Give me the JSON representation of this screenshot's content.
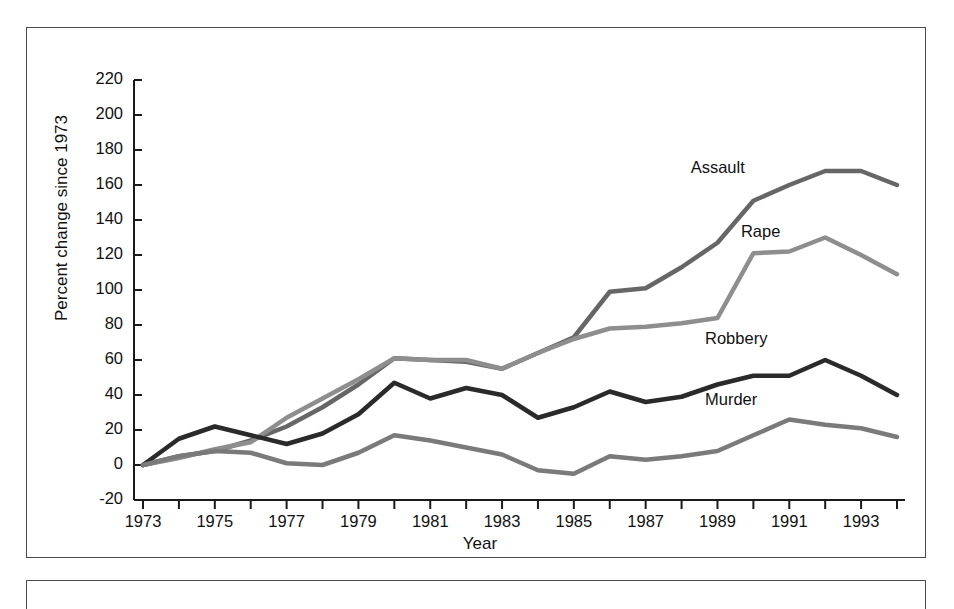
{
  "figure": {
    "ylabel": "Percent change since 1973",
    "xlabel": "Year"
  },
  "axis": {
    "y_ticks": [
      "220",
      "200",
      "180",
      "160",
      "140",
      "120",
      "100",
      "80",
      "60",
      "40",
      "20",
      "0",
      "-20"
    ],
    "x_ticks": [
      "1973",
      "1975",
      "1977",
      "1979",
      "1981",
      "1983",
      "1985",
      "1987",
      "1989",
      "1991",
      "1993"
    ]
  },
  "series_labels": {
    "assault": "Assault",
    "rape": "Rape",
    "robbery": "Robbery",
    "murder": "Murder"
  },
  "colors": {
    "assault": "#666666",
    "rape": "#8e8e8e",
    "robbery": "#2a2a2a",
    "murder": "#7a7a7a",
    "axis": "#1a1a1a",
    "frame": "#4a4a4a",
    "background": "#ffffff"
  },
  "chart_data": {
    "type": "line",
    "title": "",
    "subtitle": "",
    "xlabel": "Year",
    "ylabel": "Percent change since 1973",
    "xlim": [
      1973,
      1994
    ],
    "ylim": [
      -20,
      220
    ],
    "ytick_step": 20,
    "xtick_step": 1,
    "xtick_label_step": 2,
    "grid": false,
    "legend": "inline-labels",
    "x": [
      1973,
      1974,
      1975,
      1976,
      1977,
      1978,
      1979,
      1980,
      1981,
      1982,
      1983,
      1984,
      1985,
      1986,
      1987,
      1988,
      1989,
      1990,
      1991,
      1992,
      1993,
      1994
    ],
    "series": [
      {
        "name": "Assault",
        "color": "#666666",
        "label_pos": {
          "x": 1989.2,
          "y": 170
        },
        "values": [
          0,
          5,
          8,
          14,
          22,
          33,
          46,
          61,
          60,
          59,
          55,
          64,
          73,
          99,
          101,
          113,
          127,
          151,
          160,
          168,
          168,
          160
        ]
      },
      {
        "name": "Rape",
        "color": "#8e8e8e",
        "label_pos": {
          "x": 1990.6,
          "y": 133
        },
        "values": [
          0,
          4,
          9,
          13,
          27,
          38,
          49,
          61,
          60,
          60,
          55,
          64,
          72,
          78,
          79,
          81,
          84,
          121,
          122,
          130,
          120,
          109
        ]
      },
      {
        "name": "Robbery",
        "color": "#2a2a2a",
        "label_pos": {
          "x": 1989.6,
          "y": 72
        },
        "values": [
          0,
          15,
          22,
          17,
          12,
          18,
          29,
          47,
          38,
          44,
          40,
          27,
          33,
          42,
          36,
          39,
          46,
          51,
          51,
          60,
          51,
          40
        ]
      },
      {
        "name": "Murder",
        "color": "#7a7a7a",
        "label_pos": {
          "x": 1989.6,
          "y": 37
        },
        "values": [
          0,
          5,
          8,
          7,
          1,
          0,
          7,
          17,
          14,
          10,
          6,
          -3,
          -5,
          5,
          3,
          5,
          8,
          17,
          26,
          23,
          21,
          16
        ]
      }
    ]
  }
}
